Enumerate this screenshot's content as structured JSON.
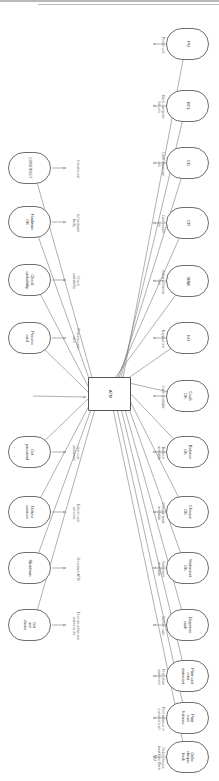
{
  "diagram": {
    "title": "ATM",
    "type": "structure-diagram",
    "orientation": "rotated-90",
    "center_node": {
      "label": "ATM",
      "shape": "rectangle"
    },
    "divider": {
      "color": "#b9b9b9"
    },
    "colors": {
      "node_border": "#6e6e6e",
      "node_fill": "#ffffff",
      "edge": "#7a7a7a",
      "edge_label": "#6a6a6a",
      "node_label": "#3a3a3a",
      "background": "#ffffff"
    },
    "nodes_row_top": [
      {
        "id": "n-pu",
        "label": "PU",
        "edge_label": "Printer unit"
      },
      {
        "id": "n-bcl",
        "label": "BCL",
        "edge_label": "Bank computer\nlink unit"
      },
      {
        "id": "n-cd",
        "label": "CD",
        "edge_label": "Cash dispenser\nunit"
      },
      {
        "id": "n-cr",
        "label": "CR",
        "edge_label": "Card reader\nunit"
      },
      {
        "id": "n-sbm",
        "label": "SBM",
        "edge_label": "Solitary Monitor\nunit"
      },
      {
        "id": "n-ku",
        "label": "KU",
        "edge_label": "Keypad unit"
      },
      {
        "id": "n-cash-ok",
        "label": "Cash\nOK",
        "edge_label": "Cash available"
      },
      {
        "id": "n-balance-ok",
        "label": "Balance\nOK",
        "edge_label": "Balance\navailable"
      },
      {
        "id": "n-cheque-ok",
        "label": "Cheque\nOK",
        "edge_label": "Cheque book\navailable"
      },
      {
        "id": "n-statement-ok",
        "label": "Statement\nOK",
        "edge_label": "Statement\navailable"
      },
      {
        "id": "n-dispense",
        "label": "Dispense\ncash",
        "edge_label": "Deliver cash"
      },
      {
        "id": "n-print-mini",
        "label": "Print cust\nmini\nstatement",
        "edge_label": "Print short\nstatement"
      },
      {
        "id": "n-print-bal",
        "label": "Print\ncust\nbalance",
        "edge_label": "Print balance in\ncustomer's a/c"
      },
      {
        "id": "n-order-cheque",
        "label": "Order\ncheque\nbook",
        "edge_label": "Order cheque\nbook from Bank\nHQ"
      }
    ],
    "nodes_row_bottom": [
      {
        "id": "n-construct",
        "label": "CONSTRUCT",
        "edge_label": "Constructor"
      },
      {
        "id": "n-hardware-ok",
        "label": "Hardware\nOK",
        "edge_label": "Is hardware\nfaulty"
      },
      {
        "id": "n-check-cash",
        "label": "Check\ncashability",
        "edge_label": "Check\ncashability"
      },
      {
        "id": "n-process-card",
        "label": "Process\ncard",
        "edge_label": "Process cash\ncard"
      },
      {
        "id": "n-get-password",
        "label": "Get\npassword",
        "edge_label": "Get cust\npassword"
      },
      {
        "id": "n-deliver",
        "label": "Deliver\nservices",
        "edge_label": "Deliver user\nservices"
      },
      {
        "id": "n-shutdown",
        "label": "Shutdown",
        "edge_label": "Shutdown ATM"
      },
      {
        "id": "n-get-choice",
        "label": "Get\nuse\nchoice",
        "edge_label": "Find out what user\nwants to do"
      }
    ]
  }
}
